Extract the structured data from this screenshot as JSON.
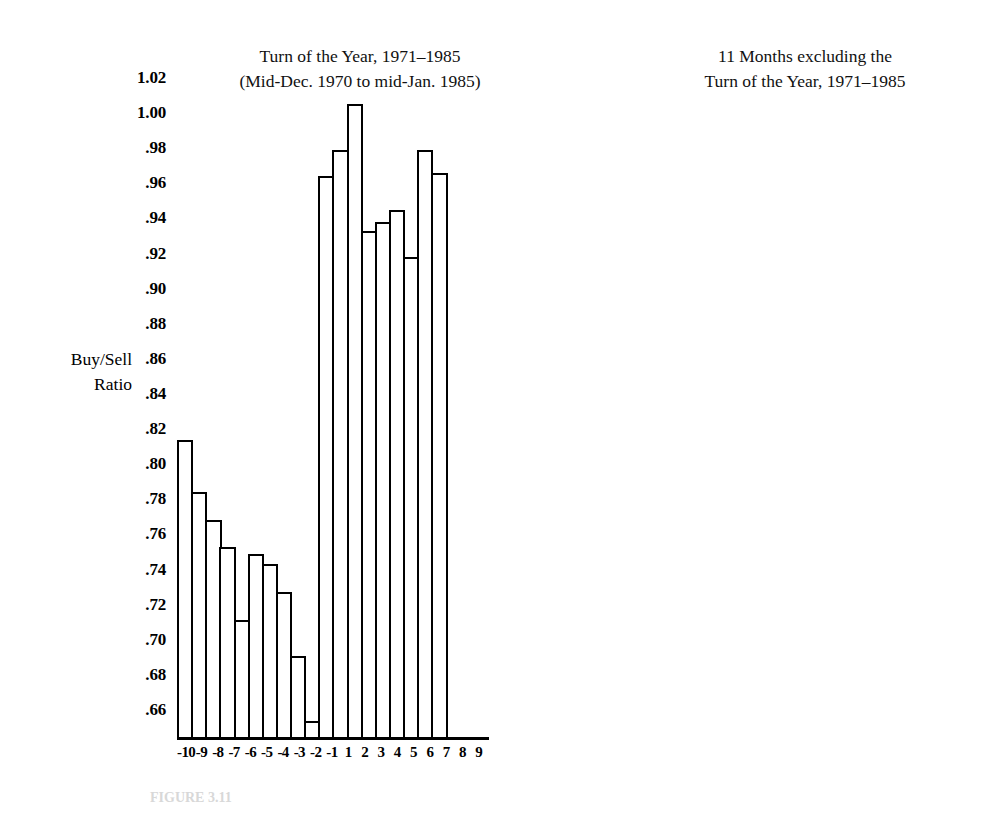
{
  "figure": {
    "caption": "FIGURE 3.11"
  },
  "axis": {
    "y_label_line1": "Buy/Sell",
    "y_label_line2": "Ratio",
    "y_ticks": [
      "1.02",
      "1.00",
      ".98",
      ".96",
      ".94",
      ".92",
      ".90",
      ".88",
      ".86",
      ".84",
      ".82",
      ".80",
      ".78",
      ".76",
      ".74",
      ".72",
      ".70",
      ".68",
      ".66"
    ]
  },
  "panels": {
    "left": {
      "title_line1": "Turn of the Year, 1971–1985",
      "title_line2": "(Mid-Dec. 1970 to mid-Jan. 1985)"
    },
    "right": {
      "title_line1": "11 Months excluding the",
      "title_line2": "Turn of the Year, 1971–1985"
    }
  },
  "chart_data": [
    {
      "type": "bar",
      "title": "Turn of the Year, 1971–1985 (Mid-Dec. 1970 to mid-Jan. 1985)",
      "xlabel": "",
      "ylabel": "Buy/Sell Ratio",
      "ylim": [
        0.65,
        1.03
      ],
      "ytick_step": 0.02,
      "grid": false,
      "legend": "none",
      "categories": [
        "-10",
        "-9",
        "-8",
        "-7",
        "-6",
        "-5",
        "-4",
        "-3",
        "-2",
        "-1",
        "1",
        "2",
        "3",
        "4",
        "5",
        "6",
        "7",
        "8",
        "9"
      ],
      "values": [
        0.814,
        0.784,
        0.768,
        0.753,
        0.711,
        0.749,
        0.743,
        0.727,
        0.691,
        0.654,
        0.964,
        0.979,
        1.005,
        0.933,
        0.938,
        0.945,
        0.918,
        0.979,
        0.966
      ]
    },
    {
      "type": "bar",
      "title": "11 Months excluding the Turn of the Year, 1971–1985",
      "xlabel": "",
      "ylabel": "Buy/Sell Ratio",
      "ylim": [
        0.65,
        1.03
      ],
      "ytick_step": 0.02,
      "grid": false,
      "legend": "none",
      "categories": [
        "-10",
        "-9",
        "-8",
        "-7",
        "-6",
        "-5",
        "-4",
        "-3",
        "-2",
        "-1",
        "1",
        "2",
        "3",
        "4",
        "5",
        "6",
        "7",
        "8",
        "9"
      ],
      "values": [
        0.911,
        0.915,
        0.927,
        0.926,
        0.927,
        0.895,
        0.899,
        0.917,
        0.927,
        0.929,
        0.915,
        0.902,
        0.907,
        0.907,
        0.902,
        0.899,
        0.898,
        0.889,
        0.908
      ]
    }
  ]
}
